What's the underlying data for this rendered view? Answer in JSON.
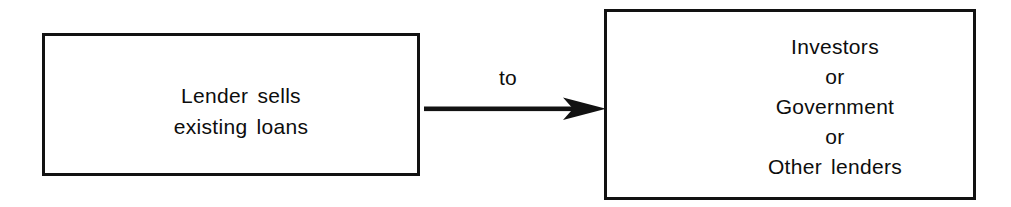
{
  "diagram": {
    "background_color": "#ffffff",
    "stroke_color": "#121212",
    "text_color": "#0d0d0d",
    "nodes": {
      "source": {
        "id": "lender",
        "lines": [
          "Lender sells",
          "existing loans"
        ],
        "line1": "Lender sells",
        "line2": "existing loans"
      },
      "target": {
        "id": "recipients",
        "lines": [
          "Investors",
          "or",
          "Government",
          "or",
          "Other lenders"
        ],
        "line1": "Investors",
        "line2": "or",
        "line3": "Government",
        "line4": "or",
        "line5": "Other lenders"
      }
    },
    "connector": {
      "label": "to",
      "direction": "left-to-right",
      "style": "solid-line-with-arrowhead"
    }
  }
}
